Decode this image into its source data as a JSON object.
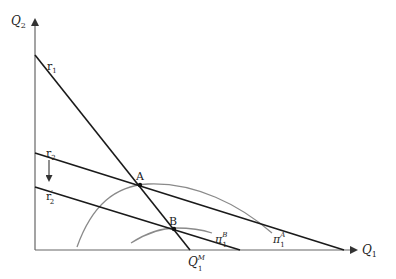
{
  "figure": {
    "axes": {
      "y_label": "Q",
      "y_sub": "2",
      "x_label": "Q",
      "x_sub": "1"
    },
    "reaction_functions": [
      {
        "id": "r1",
        "label": "r",
        "sub": "1"
      },
      {
        "id": "r2",
        "label": "r",
        "sub": "2"
      },
      {
        "id": "r2_prime",
        "label": "r",
        "sub": "2",
        "sup": "′"
      }
    ],
    "isoprofit_curves": [
      {
        "id": "pi1A",
        "label": "π",
        "sub": "1",
        "sup": "A"
      },
      {
        "id": "pi1B",
        "label": "π",
        "sub": "1",
        "sup": "B"
      }
    ],
    "points": [
      {
        "id": "A",
        "label": "A"
      },
      {
        "id": "B",
        "label": "B"
      }
    ],
    "monopoly_output": {
      "label": "Q",
      "sub": "1",
      "sup": "M"
    },
    "colors": {
      "lines": "#1a1a1a",
      "curves": "#8a8a8a",
      "axes": "#666666"
    }
  }
}
